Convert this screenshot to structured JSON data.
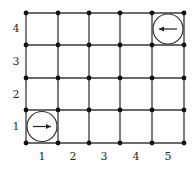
{
  "diagram": {
    "type": "grid-world",
    "columns": 5,
    "rows": 4,
    "col_labels": [
      "1",
      "2",
      "3",
      "4",
      "5"
    ],
    "row_labels": [
      "1",
      "2",
      "3",
      "4"
    ],
    "grid": {
      "x_lines": [
        26,
        58,
        89,
        120,
        152,
        184
      ],
      "y_lines": [
        143,
        110,
        78,
        45,
        13
      ],
      "line_color": "#3a3a3a",
      "dot_color": "#111111"
    },
    "agents": [
      {
        "name": "agent-start",
        "cell": [
          1,
          1
        ],
        "direction": "right",
        "arrow": "→"
      },
      {
        "name": "agent-goal",
        "cell": [
          5,
          4
        ],
        "direction": "left",
        "arrow": "←"
      }
    ]
  }
}
